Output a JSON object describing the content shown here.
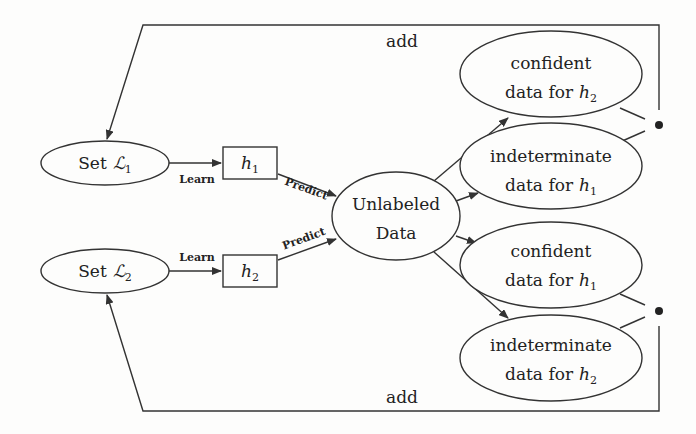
{
  "diagram": {
    "nodes": {
      "set1": {
        "label": "Set",
        "symbol": "ℒ",
        "sub": "1"
      },
      "set2": {
        "label": "Set",
        "symbol": "ℒ",
        "sub": "2"
      },
      "h1": {
        "symbol": "h",
        "sub": "1"
      },
      "h2": {
        "symbol": "h",
        "sub": "2"
      },
      "unlabeled": {
        "line1": "Unlabeled",
        "line2": "Data"
      },
      "conf_h2": {
        "line1": "confident",
        "line2": "data for",
        "symbol": "h",
        "sub": "2"
      },
      "indet_h1": {
        "line1": "indeterminate",
        "line2": "data for",
        "symbol": "h",
        "sub": "1"
      },
      "conf_h1": {
        "line1": "confident",
        "line2": "data for",
        "symbol": "h",
        "sub": "1"
      },
      "indet_h2": {
        "line1": "indeterminate",
        "line2": "data for",
        "symbol": "h",
        "sub": "2"
      }
    },
    "edges": {
      "learn1": "Learn",
      "learn2": "Learn",
      "predict1": "Predict",
      "predict2": "Predict",
      "add_top": "add",
      "add_bottom": "add"
    }
  }
}
